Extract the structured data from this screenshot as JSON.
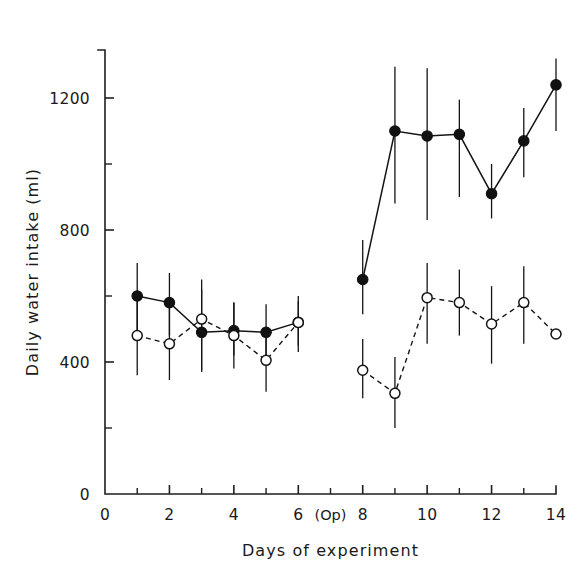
{
  "chart_data": {
    "type": "line",
    "title": "",
    "xlabel": "Days  of  experiment",
    "ylabel": "Daily  water  intake  (ml)",
    "xlim": [
      0,
      14
    ],
    "ylim": [
      0,
      1300
    ],
    "grid": false,
    "legend_position": "none",
    "x_major_ticks": [
      0,
      2,
      4,
      6,
      8,
      10,
      12,
      14
    ],
    "x_major_tick_labels": [
      "0",
      "2",
      "4",
      "6",
      "8",
      "10",
      "12",
      "14"
    ],
    "x_minor_ticks": [
      1,
      3,
      5,
      7,
      9,
      11,
      13
    ],
    "y_major_ticks": [
      0,
      400,
      800,
      1200
    ],
    "y_major_tick_labels": [
      "0",
      "400",
      "800",
      "1200"
    ],
    "y_minor_ticks": [
      200,
      600,
      1000
    ],
    "annotations": [
      {
        "text": "(Op)",
        "x": 7,
        "axis": "x",
        "note": "operation marker between day 6 and day 8"
      }
    ],
    "series": [
      {
        "name": "filled-circles",
        "marker": "filled-circle",
        "line_style": "solid",
        "color": "#111111",
        "x": [
          1,
          2,
          3,
          4,
          5,
          6,
          8,
          9,
          10,
          11,
          12,
          13,
          14
        ],
        "values": [
          600,
          580,
          490,
          495,
          490,
          520,
          650,
          1100,
          1085,
          1090,
          910,
          1070,
          1240
        ],
        "err_low": [
          490,
          480,
          370,
          420,
          400,
          450,
          545,
          880,
          830,
          900,
          835,
          960,
          1100
        ],
        "err_high": [
          700,
          670,
          620,
          580,
          575,
          585,
          770,
          1295,
          1290,
          1195,
          1000,
          1170,
          1320
        ]
      },
      {
        "name": "open-circles",
        "marker": "open-circle",
        "line_style": "dashed",
        "color": "#141414",
        "x": [
          1,
          2,
          3,
          4,
          5,
          6,
          8,
          9,
          10,
          11,
          12,
          13,
          14
        ],
        "values": [
          480,
          455,
          530,
          480,
          405,
          520,
          375,
          305,
          595,
          580,
          515,
          580,
          485
        ],
        "err_low": [
          360,
          345,
          375,
          380,
          310,
          430,
          290,
          200,
          455,
          480,
          395,
          455,
          485
        ],
        "err_high": [
          595,
          575,
          650,
          580,
          500,
          600,
          470,
          415,
          700,
          680,
          630,
          690,
          485
        ]
      }
    ]
  },
  "axis": {
    "y_title": "Daily  water  intake  (ml)",
    "x_title": "Days  of  experiment",
    "origin_label": "0",
    "op_label": "(Op)"
  }
}
